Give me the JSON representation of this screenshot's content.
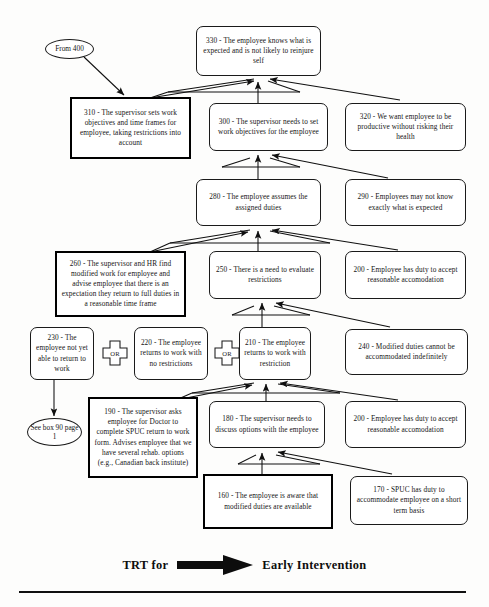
{
  "diagram": {
    "footer": {
      "left_label": "TRT for",
      "right_label": "Early Intervention",
      "arrow_icon": "thick-right-arrow-icon"
    },
    "terminators": [
      {
        "id": "from-400",
        "text": "From 400"
      },
      {
        "id": "see-box-90",
        "text": "See box 90 page 1"
      }
    ],
    "connectors": [
      {
        "id": "or-1",
        "label": "OR"
      },
      {
        "id": "or-2",
        "label": "OR"
      }
    ],
    "nodes": [
      {
        "id": "330",
        "number": "330",
        "text": "330 - The employee knows what is expected and is not likely to reinjure self",
        "emphasis": false
      },
      {
        "id": "310",
        "number": "310",
        "text": "310 - The supervisor sets work objectives and time frames for employee, taking restrictions into account",
        "emphasis": true
      },
      {
        "id": "300",
        "number": "300",
        "text": "300 - The supervisor needs to set work objectives for the employee",
        "emphasis": false
      },
      {
        "id": "320",
        "number": "320",
        "text": "320 -  We want employee to be productive without risking their health",
        "emphasis": false
      },
      {
        "id": "280",
        "number": "280",
        "text": "280 - The employee assumes the assigned duties",
        "emphasis": false
      },
      {
        "id": "290",
        "number": "290",
        "text": "290 - Employees may not know exactly what is expected",
        "emphasis": false
      },
      {
        "id": "260",
        "number": "260",
        "text": "260 - The supervisor and HR find modified work for employee and advise employee that there is an expectation they return to full duties in a reasonable time frame",
        "emphasis": true
      },
      {
        "id": "250",
        "number": "250",
        "text": "250 - There is a need to evaluate  restrictions",
        "emphasis": false
      },
      {
        "id": "200a",
        "number": "200",
        "text": "200 - Employee has duty to accept reasonable accomodation",
        "emphasis": false
      },
      {
        "id": "230",
        "number": "230",
        "text": "230 - The employee not yet able to return to work",
        "emphasis": false
      },
      {
        "id": "220",
        "number": "220",
        "text": "220 - The employee returns to work with no restrictions",
        "emphasis": false
      },
      {
        "id": "210",
        "number": "210",
        "text": "210 - The employee returns to work with restriction",
        "emphasis": false
      },
      {
        "id": "240",
        "number": "240",
        "text": "240 - Modified duties cannot be accommodated  indefinitely",
        "emphasis": false
      },
      {
        "id": "190",
        "number": "190",
        "text": "190 - The supervisor asks employee for Doctor to complete SPUC return to work form. Advises employee that we have several rehab. options (e.g., Canadian back institute)",
        "emphasis": true
      },
      {
        "id": "180",
        "number": "180",
        "text": "180 - The supervisor needs to discuss options with the employee",
        "emphasis": false
      },
      {
        "id": "200b",
        "number": "200",
        "text": "200 - Employee has duty to accept reasonable accomodation",
        "emphasis": false
      },
      {
        "id": "160",
        "number": "160",
        "text": "160 - The employee is aware that modified duties are available",
        "emphasis": true
      },
      {
        "id": "170",
        "number": "170",
        "text": "170 - SPUC has duty to accommodate  employee on a short term basis",
        "emphasis": false
      }
    ],
    "colors": {
      "ink": "#141414",
      "paper": "#fdfdfc",
      "emphasis_border": "#000000"
    }
  }
}
